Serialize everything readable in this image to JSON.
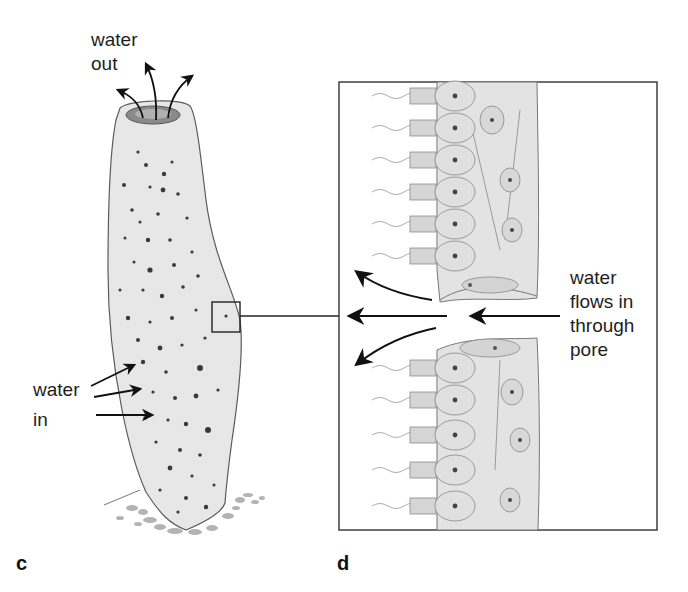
{
  "figure": {
    "type": "biology-illustration",
    "colors": {
      "line": "#2a2a2a",
      "body_fill": "#e6e6e6",
      "pore_dot": "#3a3a3a",
      "cell_fill": "#e2e2e2",
      "background": "#ffffff"
    }
  },
  "panel_c": {
    "letter": "c",
    "label_water_out": {
      "line1": "water",
      "line2": "out"
    },
    "label_water_in": {
      "line1": "water",
      "line2": "in"
    },
    "arrows_out_count": 3,
    "arrows_in_count": 3,
    "inset_marker": "detail box"
  },
  "panel_d": {
    "letter": "d",
    "label_flow": {
      "line1": "water",
      "line2": "flows in",
      "line3": "through",
      "line4": "pore"
    },
    "collar_cells_upper": 6,
    "collar_cells_lower": 6
  }
}
